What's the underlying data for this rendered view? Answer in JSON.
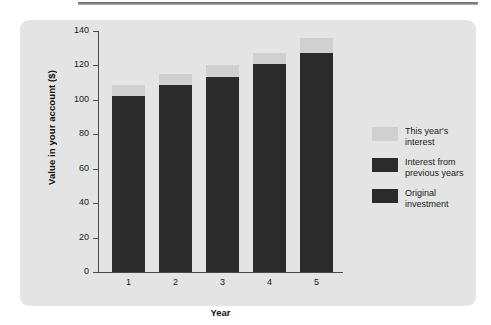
{
  "figure": {
    "panel_background": "#e4e4e4",
    "top_rule_color": "#7a7a7a"
  },
  "chart_data": {
    "type": "bar",
    "stacked": true,
    "title": "",
    "xlabel": "Year",
    "ylabel": "Value in your account ($)",
    "categories": [
      "1",
      "2",
      "3",
      "4",
      "5"
    ],
    "ylim": [
      0,
      140
    ],
    "yticks": [
      0,
      20,
      40,
      60,
      80,
      100,
      120,
      140
    ],
    "ytick_labels": [
      "0",
      "20",
      "40",
      "60",
      "80",
      "100",
      "120",
      "140"
    ],
    "grid": false,
    "legend_position": "right",
    "series": [
      {
        "name": "Original investment",
        "color": "#2b2b2b",
        "values": [
          100,
          100,
          100,
          100,
          100
        ]
      },
      {
        "name": "Interest from previous years",
        "color": "#2b2b2b",
        "values": [
          2,
          8.5,
          13.5,
          21,
          27
        ]
      },
      {
        "name": "This year's interest",
        "color": "#d0d0d0",
        "values": [
          6.7,
          6.5,
          6.5,
          6.5,
          8.8
        ]
      }
    ],
    "totals": [
      108.7,
      115,
      120,
      127.5,
      135.8
    ]
  },
  "legend": {
    "items": [
      {
        "label": "This year's\ninterest",
        "color": "#d0d0d0"
      },
      {
        "label": "Interest from\nprevious years",
        "color": "#2b2b2b"
      },
      {
        "label": "Original\ninvestment",
        "color": "#2b2b2b"
      }
    ]
  }
}
